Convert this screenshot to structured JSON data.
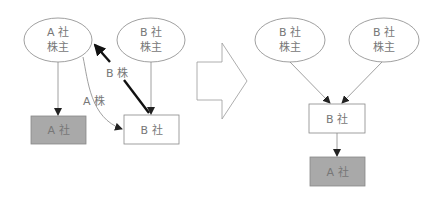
{
  "colors": {
    "line": "#888888",
    "thick_arrow": "#111111",
    "gray_box": "#a9a9a9",
    "text": "#777777"
  },
  "before": {
    "a_shareholders": {
      "line1": "A 社",
      "line2": "株主"
    },
    "b_shareholders": {
      "line1": "B 社",
      "line2": "株主"
    },
    "company_a": "A 社",
    "company_b": "B 社",
    "arrow_b_shares_label": "B 株",
    "arrow_a_shares_label": "A 株"
  },
  "after": {
    "shareholders_left": {
      "line1": "B 社",
      "line2": "株主"
    },
    "shareholders_right": {
      "line1": "B 社",
      "line2": "株主"
    },
    "company_b": "B 社",
    "company_a": "A 社"
  }
}
